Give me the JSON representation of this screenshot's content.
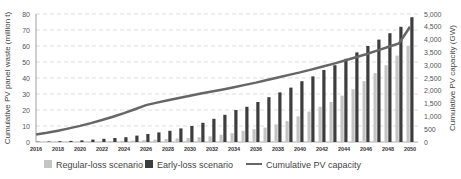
{
  "chart_data": {
    "type": "bar",
    "title": "",
    "xlabel": "",
    "ylabel": "Cumulative PV panel waste (million t)",
    "y2label": "Cumulative PV capacity (GW)",
    "ylim": [
      0,
      80
    ],
    "y2lim": [
      0,
      5000
    ],
    "yticks": [
      0,
      10,
      20,
      30,
      40,
      50,
      60,
      70,
      80
    ],
    "y2ticks": [
      "0",
      "500",
      "1,000",
      "1,500",
      "2,000",
      "2,500",
      "3,000",
      "3,500",
      "4,000",
      "4,500",
      "5,000"
    ],
    "xtick_labels": [
      "2016",
      "2018",
      "2020",
      "2022",
      "2024",
      "2026",
      "2028",
      "2030",
      "2032",
      "2034",
      "2036",
      "2038",
      "2040",
      "2042",
      "2044",
      "2046",
      "2048",
      "2050"
    ],
    "grid": "horizontal dashed",
    "legend_position": "bottom",
    "categories": [
      2016,
      2017,
      2018,
      2019,
      2020,
      2021,
      2022,
      2023,
      2024,
      2025,
      2026,
      2027,
      2028,
      2029,
      2030,
      2031,
      2032,
      2033,
      2034,
      2035,
      2036,
      2037,
      2038,
      2039,
      2040,
      2041,
      2042,
      2043,
      2044,
      2045,
      2046,
      2047,
      2048,
      2049,
      2050
    ],
    "series": [
      {
        "name": "Regular-loss scenario",
        "type": "bar",
        "axis": "left",
        "color": "#c4c4c4",
        "values": [
          0.05,
          0.07,
          0.1,
          0.15,
          0.2,
          0.3,
          0.4,
          0.5,
          0.7,
          0.9,
          1.2,
          1.5,
          1.8,
          2.2,
          2.5,
          3,
          3.5,
          4.5,
          5.5,
          7,
          8,
          9,
          11,
          13,
          16,
          19,
          22,
          25,
          29,
          33,
          38,
          43,
          48,
          54,
          60
        ]
      },
      {
        "name": "Early-loss scenario",
        "type": "bar",
        "axis": "left",
        "color": "#3d3d3d",
        "values": [
          0.2,
          0.3,
          0.5,
          0.7,
          1,
          1.5,
          2,
          2.5,
          3,
          4,
          5,
          6,
          7,
          8.5,
          10,
          12,
          14.5,
          17,
          20,
          22,
          25,
          28,
          31,
          34,
          38,
          41,
          45,
          48,
          52,
          56,
          60,
          64,
          68,
          72,
          78
        ]
      },
      {
        "name": "Cumulative PV capacity",
        "type": "line",
        "axis": "right",
        "color": "#666666",
        "values": [
          290,
          360,
          440,
          530,
          630,
          740,
          860,
          990,
          1130,
          1280,
          1440,
          1540,
          1630,
          1720,
          1810,
          1890,
          1970,
          2050,
          2140,
          2230,
          2320,
          2420,
          2520,
          2620,
          2720,
          2830,
          2940,
          3050,
          3170,
          3300,
          3430,
          3570,
          3710,
          3850,
          4500
        ]
      }
    ]
  },
  "legend": {
    "regular": "Regular-loss scenario",
    "early": "Early-loss scenario",
    "capacity": "Cumulative PV capacity"
  },
  "axes": {
    "left_title": "Cumulative PV panel waste (million t)",
    "right_title": "Cumulative PV capacity (GW)"
  }
}
